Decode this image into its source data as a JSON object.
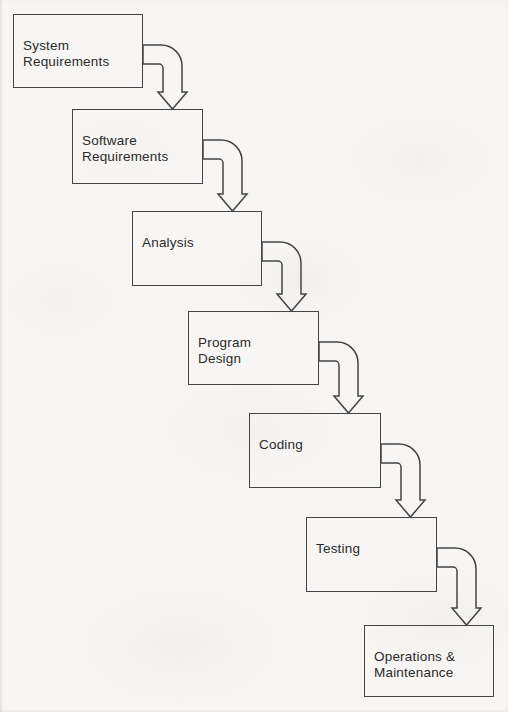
{
  "diagram": {
    "type": "flowchart",
    "nodes": [
      {
        "id": "system-requirements",
        "label": "System\nRequirements"
      },
      {
        "id": "software-requirements",
        "label": "Software\nRequirements"
      },
      {
        "id": "analysis",
        "label": "Analysis"
      },
      {
        "id": "program-design",
        "label": "Program\nDesign"
      },
      {
        "id": "coding",
        "label": "Coding"
      },
      {
        "id": "testing",
        "label": "Testing"
      },
      {
        "id": "operations-maintenance",
        "label": "Operations &\nMaintenance"
      }
    ],
    "edges": [
      {
        "from": "system-requirements",
        "to": "software-requirements",
        "style": "hollow-bent-arrow"
      },
      {
        "from": "software-requirements",
        "to": "analysis",
        "style": "hollow-bent-arrow"
      },
      {
        "from": "analysis",
        "to": "program-design",
        "style": "hollow-bent-arrow"
      },
      {
        "from": "program-design",
        "to": "coding",
        "style": "hollow-bent-arrow"
      },
      {
        "from": "coding",
        "to": "testing",
        "style": "hollow-bent-arrow"
      },
      {
        "from": "testing",
        "to": "operations-maintenance",
        "style": "hollow-bent-arrow"
      }
    ],
    "colors": {
      "line": "#454545",
      "text": "#2b2b2b",
      "background": "#f7f6f4"
    }
  }
}
